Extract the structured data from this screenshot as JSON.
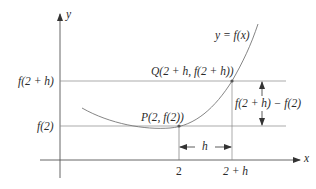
{
  "figure": {
    "axes": {
      "x_label": "x",
      "y_label": "y"
    },
    "curve_label": "y = f(x)",
    "points": {
      "P": {
        "label": "P(2, f(2))"
      },
      "Q": {
        "label": "Q(2 + h, f(2 + h))"
      }
    },
    "y_ticks": {
      "upper": "f(2 + h)",
      "lower": "f(2)"
    },
    "x_ticks": {
      "left": "2",
      "right": "2 + h"
    },
    "horizontal_span_label": "h",
    "vertical_span_label": "f(2 + h) − f(2)",
    "colors": {
      "line": "#555555",
      "curve": "#777777",
      "text": "#2a2a2a",
      "background": "#ffffff"
    }
  }
}
